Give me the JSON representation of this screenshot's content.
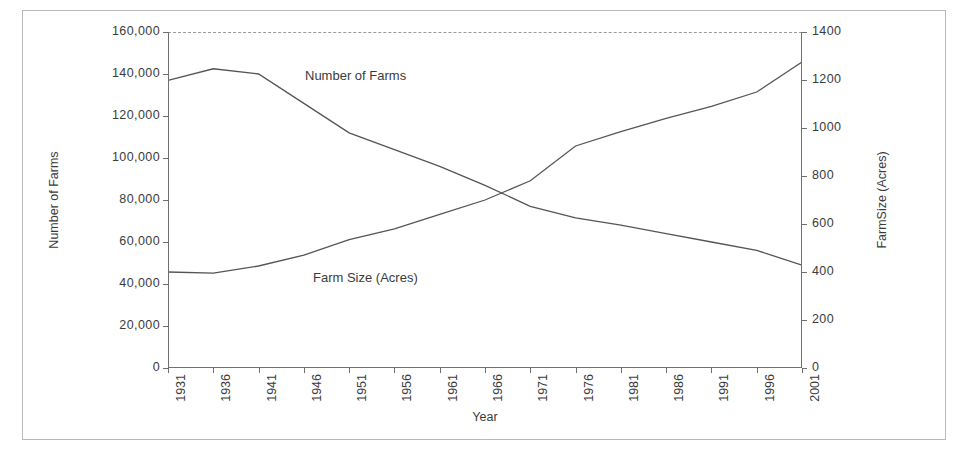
{
  "chart_data": {
    "type": "line",
    "title": "",
    "xlabel": "Year",
    "ylabel": "Number of Farms",
    "y2label": "FarmSize (Acres)",
    "grid": false,
    "legend_position": "inline-annotations",
    "x": [
      1931,
      1936,
      1941,
      1946,
      1951,
      1956,
      1961,
      1966,
      1971,
      1976,
      1981,
      1986,
      1991,
      1996,
      2001
    ],
    "categories": [
      "1931",
      "1936",
      "1941",
      "1946",
      "1951",
      "1956",
      "1961",
      "1966",
      "1971",
      "1976",
      "1981",
      "1986",
      "1991",
      "1996",
      "2001"
    ],
    "xlim": [
      1931,
      2001
    ],
    "ylim": [
      0,
      160000
    ],
    "y2lim": [
      0,
      1400
    ],
    "yticks": [
      "0",
      "20,000",
      "40,000",
      "60,000",
      "80,000",
      "100,000",
      "120,000",
      "140,000",
      "160,000"
    ],
    "ytick_values": [
      0,
      20000,
      40000,
      60000,
      80000,
      100000,
      120000,
      140000,
      160000
    ],
    "y2ticks": [
      "0",
      "200",
      "400",
      "600",
      "800",
      "1000",
      "1200",
      "1400"
    ],
    "y2tick_values": [
      0,
      200,
      400,
      600,
      800,
      1000,
      1200,
      1400
    ],
    "series": [
      {
        "name": "Number of Farms",
        "axis": "left",
        "label_text": "Number of Farms",
        "values": [
          137000,
          142500,
          140000,
          126000,
          112000,
          104000,
          96000,
          87000,
          77000,
          71500,
          68000,
          64000,
          60000,
          56000,
          49000
        ]
      },
      {
        "name": "Farm Size (Acres)",
        "axis": "right",
        "label_text": "Farm Size  (Acres)",
        "values": [
          400,
          395,
          425,
          470,
          535,
          580,
          640,
          700,
          780,
          925,
          985,
          1040,
          1090,
          1150,
          1275
        ]
      }
    ]
  },
  "axes": {
    "left_title": "Number of Farms",
    "right_title": "FarmSize (Acres)",
    "x_title": "Year"
  },
  "style": {
    "line_color": "#555555",
    "frame_color": "#b9b9b9",
    "plot_border_color": "#9a9a9a",
    "text_color": "#3b3b3b",
    "background": "#ffffff"
  }
}
